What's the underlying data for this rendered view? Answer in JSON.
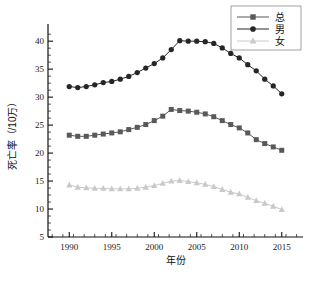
{
  "chart_data": {
    "type": "line",
    "title": "",
    "xlabel": "年份",
    "ylabel": "死亡率（/10万）",
    "x": [
      1990,
      1991,
      1992,
      1993,
      1994,
      1995,
      1996,
      1997,
      1998,
      1999,
      2000,
      2001,
      2002,
      2003,
      2004,
      2005,
      2006,
      2007,
      2008,
      2009,
      2010,
      2011,
      2012,
      2013,
      2014,
      2015
    ],
    "xlim": [
      1987.5,
      2017.5
    ],
    "ylim": [
      5,
      42
    ],
    "xticks": [
      1990,
      1995,
      2000,
      2005,
      2010,
      2015
    ],
    "yticks": [
      5,
      10,
      15,
      20,
      25,
      30,
      35,
      40
    ],
    "xtick_labels": [
      "1990",
      "1995",
      "2000",
      "2005",
      "2010",
      "2015"
    ],
    "ytick_labels": [
      "5",
      "10",
      "15",
      "20",
      "25",
      "30",
      "35",
      "40"
    ],
    "minor_ticks": true,
    "grid": false,
    "legend_position": "top-right",
    "series": [
      {
        "name": "总",
        "marker": "square",
        "color": "#595959",
        "values": [
          23.2,
          23.0,
          23.0,
          23.2,
          23.4,
          23.6,
          23.8,
          24.2,
          24.6,
          25.1,
          25.8,
          26.6,
          27.8,
          27.6,
          27.5,
          27.3,
          27.0,
          26.5,
          25.8,
          25.1,
          24.5,
          23.6,
          22.4,
          21.7,
          21.1,
          20.5
        ]
      },
      {
        "name": "男",
        "marker": "circle",
        "color": "#262626",
        "values": [
          31.9,
          31.7,
          31.9,
          32.2,
          32.6,
          32.8,
          33.2,
          33.7,
          34.4,
          35.2,
          36.0,
          37.0,
          38.5,
          40.1,
          40.0,
          40.0,
          39.9,
          39.6,
          38.8,
          37.8,
          37.0,
          35.8,
          34.7,
          33.2,
          32.0,
          30.6
        ]
      },
      {
        "name": "女",
        "marker": "triangle",
        "color": "#c9c9c9",
        "values": [
          14.3,
          13.9,
          13.8,
          13.7,
          13.7,
          13.6,
          13.6,
          13.6,
          13.7,
          13.9,
          14.2,
          14.6,
          15.0,
          15.1,
          14.9,
          14.7,
          14.4,
          14.0,
          13.5,
          13.0,
          12.7,
          12.1,
          11.5,
          11.0,
          10.5,
          9.9
        ]
      }
    ]
  },
  "legend": {
    "items": [
      {
        "label": "总"
      },
      {
        "label": "男"
      },
      {
        "label": "女"
      }
    ]
  },
  "axes": {
    "x_title": "年份",
    "y_title": "死亡率（/10万）"
  }
}
